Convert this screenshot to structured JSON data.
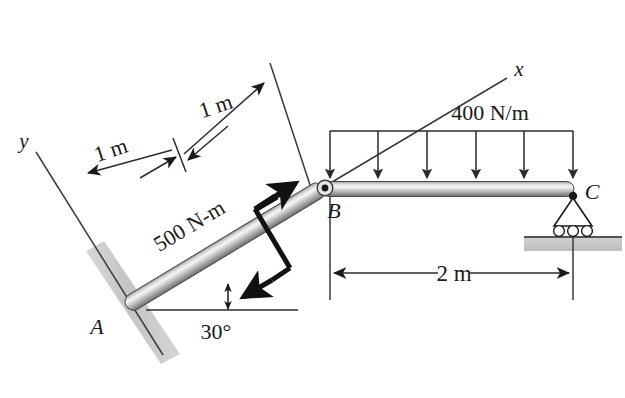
{
  "figure": {
    "type": "engineering-statics-free-body-diagram",
    "background_color": "#ffffff",
    "ink_color": "#1a1a1a",
    "member_fill_light": "#f2f2f2",
    "member_fill_mid": "#b9b9b9",
    "member_fill_dark": "#7a7a7a",
    "support_gray": "#c9c9c9"
  },
  "axes": {
    "x_label": "x",
    "y_label": "y"
  },
  "points": {
    "a_label": "A",
    "b_label": "B",
    "c_label": "C"
  },
  "loads": {
    "distributed_label": "400 N/m",
    "distributed_arrow_count": 6,
    "couple_label": "500 N-m"
  },
  "dimensions": {
    "ab_first_segment": "1 m",
    "ab_second_segment": "1 m",
    "bc_span": "2 m",
    "incline_angle": "30°"
  }
}
